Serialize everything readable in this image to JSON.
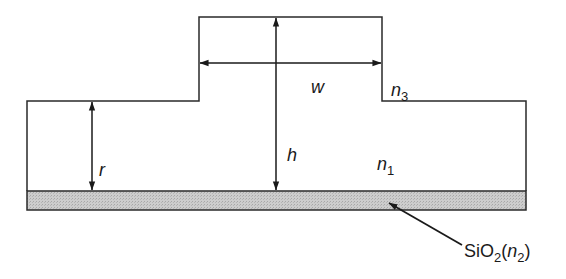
{
  "diagram": {
    "type": "rib-waveguide-cross-section",
    "colors": {
      "stroke": "#2a2a2a",
      "substrate_fill": "#c9c9c9",
      "background": "#ffffff"
    },
    "labels": {
      "width": "w",
      "height": "h",
      "slab": "r",
      "core_index": "n",
      "core_index_sub": "1",
      "cover_index": "n",
      "cover_index_sub": "3",
      "substrate_prefix": "SiO",
      "substrate_prefix_sub": "2",
      "substrate_open": "(",
      "substrate_index": "n",
      "substrate_index_sub": "2",
      "substrate_close": ")"
    }
  }
}
